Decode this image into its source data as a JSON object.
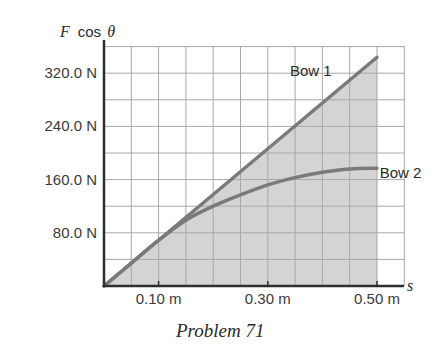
{
  "chart_data": {
    "type": "line",
    "title": "",
    "caption": "Problem 71",
    "xlabel": "s",
    "ylabel": "F cos θ",
    "ylabel_parts": {
      "var": "F",
      "func": "cos",
      "angle": "θ"
    },
    "xlim": [
      0,
      0.55
    ],
    "ylim": [
      0,
      360
    ],
    "grid": true,
    "grid_step_x": 0.05,
    "grid_step_y": 40,
    "shaded_area": {
      "under": "Bow 1",
      "x_range": [
        0,
        0.5
      ],
      "color": "#d4d4d4"
    },
    "x_ticks": [
      {
        "value": 0.1,
        "label": "0.10 m"
      },
      {
        "value": 0.3,
        "label": "0.30 m"
      },
      {
        "value": 0.5,
        "label": "0.50 m"
      }
    ],
    "y_ticks": [
      {
        "value": 80,
        "label": "80.0 N"
      },
      {
        "value": 160,
        "label": "160.0 N"
      },
      {
        "value": 240,
        "label": "240.0 N"
      },
      {
        "value": 320,
        "label": "320.0 N"
      }
    ],
    "x": [
      0,
      0.05,
      0.1,
      0.15,
      0.2,
      0.25,
      0.3,
      0.35,
      0.4,
      0.45,
      0.5
    ],
    "series": [
      {
        "name": "Bow 1",
        "values": [
          0,
          34.4,
          68.8,
          103.2,
          137.6,
          172,
          206.4,
          240.8,
          275.2,
          309.6,
          344
        ],
        "color": "#7a7a7a"
      },
      {
        "name": "Bow 2",
        "values": [
          0,
          34.4,
          68.8,
          99,
          120,
          137,
          152,
          163,
          171,
          176,
          177
        ],
        "color": "#7a7a7a"
      }
    ],
    "annotations": [
      {
        "text": "Bow 1",
        "x": 0.39,
        "y": 324
      },
      {
        "text": "Bow 2",
        "x": 0.505,
        "y": 170
      }
    ]
  }
}
